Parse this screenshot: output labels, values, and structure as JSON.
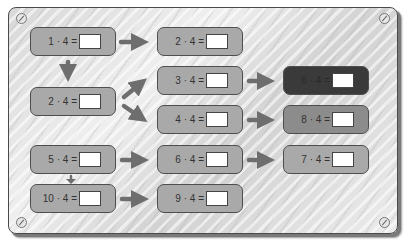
{
  "board": {
    "background_color": "#e0e0e0",
    "card_color": "#a9a9a9",
    "card_dark_color": "#3a3a3a",
    "card_mid_color": "#8c8c8c",
    "arrow_color": "#6e6e6e"
  },
  "cards": [
    {
      "id": "c1",
      "label": "1 · 4 =",
      "answer": ""
    },
    {
      "id": "c2",
      "label": "2 · 4 =",
      "answer": ""
    },
    {
      "id": "c3",
      "label": "5 · 4 =",
      "answer": ""
    },
    {
      "id": "c4",
      "label": "10 · 4 =",
      "answer": ""
    },
    {
      "id": "c5",
      "label": "2 · 4 =",
      "answer": ""
    },
    {
      "id": "c6",
      "label": "3 · 4 =",
      "answer": ""
    },
    {
      "id": "c7",
      "label": "4 · 4 =",
      "answer": ""
    },
    {
      "id": "c8",
      "label": "6 · 4 =",
      "answer": ""
    },
    {
      "id": "c9",
      "label": "9 · 4 =",
      "answer": ""
    },
    {
      "id": "c10",
      "label": "6 · 4 =",
      "answer": ""
    },
    {
      "id": "c11",
      "label": "8 · 4 =",
      "answer": ""
    },
    {
      "id": "c12",
      "label": "7 · 4 =",
      "answer": ""
    }
  ]
}
